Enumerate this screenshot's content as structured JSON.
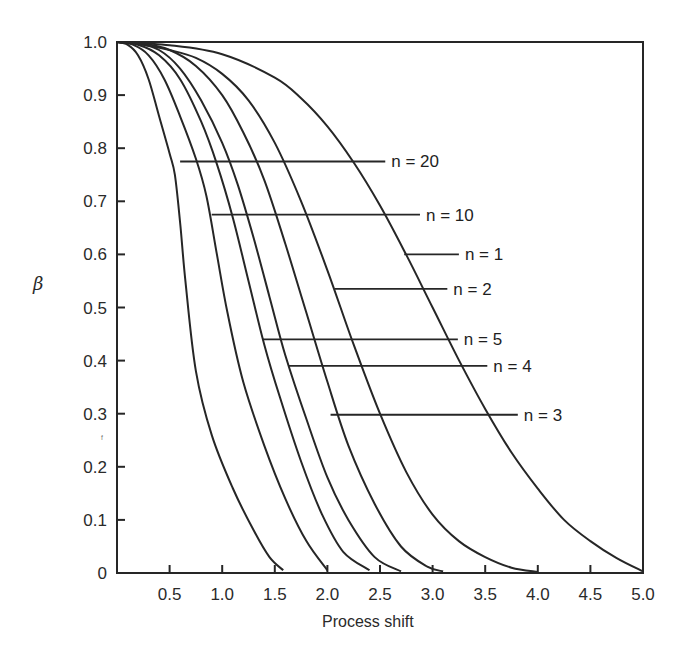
{
  "chart_data": {
    "type": "line",
    "title": "",
    "xlabel": "Process shift",
    "ylabel": "β",
    "xlim": [
      0,
      5.0
    ],
    "ylim": [
      0,
      1.0
    ],
    "grid": false,
    "x_ticks": [
      "0.5",
      "1.0",
      "1.5",
      "2.0",
      "2.5",
      "3.0",
      "3.5",
      "4.0",
      "4.5",
      "5.0"
    ],
    "x_tick_values": [
      0.5,
      1.0,
      1.5,
      2.0,
      2.5,
      3.0,
      3.5,
      4.0,
      4.5,
      5.0
    ],
    "y_ticks": [
      "0",
      "0.1",
      "0.2",
      "0.3",
      "0.4",
      "0.5",
      "0.6",
      "0.7",
      "0.8",
      "0.9",
      "1.0"
    ],
    "y_tick_values": [
      0,
      0.1,
      0.2,
      0.3,
      0.4,
      0.5,
      0.6,
      0.7,
      0.8,
      0.9,
      1.0
    ],
    "legend_position": "inline leader-line labels",
    "series": [
      {
        "name": "n = 20",
        "label_y": 0.775,
        "label_x_start": 0.6,
        "label_x_end": 2.55,
        "x": [
          0,
          0.1,
          0.2,
          0.3,
          0.4,
          0.5,
          0.55,
          0.6,
          0.65,
          0.75,
          0.9,
          1.1,
          1.3,
          1.45,
          1.58
        ],
        "y": [
          1.0,
          0.995,
          0.975,
          0.93,
          0.86,
          0.79,
          0.75,
          0.66,
          0.55,
          0.38,
          0.26,
          0.16,
          0.08,
          0.03,
          0.005
        ]
      },
      {
        "name": "n = 10",
        "label_y": 0.675,
        "label_x_start": 0.9,
        "label_x_end": 2.88,
        "x": [
          0,
          0.15,
          0.3,
          0.45,
          0.6,
          0.75,
          0.85,
          0.95,
          1.05,
          1.2,
          1.4,
          1.6,
          1.8,
          2.0
        ],
        "y": [
          1.0,
          0.995,
          0.975,
          0.93,
          0.86,
          0.78,
          0.71,
          0.6,
          0.49,
          0.36,
          0.24,
          0.14,
          0.06,
          0.005
        ]
      },
      {
        "name": "n = 5",
        "label_y": 0.44,
        "label_x_start": 1.38,
        "label_x_end": 3.24,
        "x": [
          0,
          0.2,
          0.4,
          0.6,
          0.8,
          0.95,
          1.1,
          1.25,
          1.4,
          1.55,
          1.75,
          1.95,
          2.15,
          2.4
        ],
        "y": [
          1.0,
          0.995,
          0.975,
          0.93,
          0.85,
          0.77,
          0.67,
          0.55,
          0.43,
          0.33,
          0.21,
          0.11,
          0.04,
          0.005
        ]
      },
      {
        "name": "n = 4",
        "label_y": 0.39,
        "label_x_start": 1.63,
        "label_x_end": 3.52,
        "x": [
          0,
          0.2,
          0.4,
          0.6,
          0.8,
          1.0,
          1.15,
          1.3,
          1.45,
          1.6,
          1.8,
          2.0,
          2.2,
          2.45,
          2.7
        ],
        "y": [
          1.0,
          0.997,
          0.985,
          0.95,
          0.89,
          0.81,
          0.73,
          0.63,
          0.52,
          0.41,
          0.29,
          0.18,
          0.1,
          0.03,
          0.003
        ]
      },
      {
        "name": "n = 3",
        "label_y": 0.298,
        "label_x_start": 2.03,
        "label_x_end": 3.81,
        "x": [
          0,
          0.25,
          0.5,
          0.75,
          1.0,
          1.2,
          1.4,
          1.6,
          1.8,
          2.0,
          2.2,
          2.45,
          2.7,
          2.95,
          3.1
        ],
        "y": [
          1.0,
          0.997,
          0.985,
          0.955,
          0.9,
          0.83,
          0.74,
          0.62,
          0.49,
          0.36,
          0.24,
          0.13,
          0.05,
          0.012,
          0.003
        ]
      },
      {
        "name": "n = 2",
        "label_y": 0.535,
        "label_x_start": 2.07,
        "label_x_end": 3.14,
        "x": [
          0,
          0.25,
          0.5,
          0.75,
          1.0,
          1.25,
          1.5,
          1.75,
          2.0,
          2.25,
          2.5,
          2.75,
          3.0,
          3.25,
          3.5,
          3.75,
          4.0
        ],
        "y": [
          1.0,
          0.995,
          0.985,
          0.97,
          0.94,
          0.89,
          0.81,
          0.7,
          0.57,
          0.43,
          0.3,
          0.19,
          0.11,
          0.06,
          0.03,
          0.01,
          0.002
        ]
      },
      {
        "name": "n = 1",
        "label_y": 0.6,
        "label_x_start": 2.73,
        "label_x_end": 3.25,
        "x": [
          0,
          0.5,
          1.0,
          1.5,
          1.75,
          2.0,
          2.25,
          2.5,
          2.75,
          3.0,
          3.25,
          3.5,
          3.75,
          4.0,
          4.25,
          4.5,
          4.75,
          5.0
        ],
        "y": [
          1.0,
          0.994,
          0.977,
          0.933,
          0.894,
          0.841,
          0.773,
          0.692,
          0.599,
          0.5,
          0.401,
          0.309,
          0.227,
          0.159,
          0.1,
          0.06,
          0.028,
          0.003
        ]
      }
    ]
  },
  "plot_area": {
    "left": 117,
    "right": 643,
    "top": 42,
    "bottom": 573
  },
  "labels": {
    "y_axis_symbol": "β",
    "x_axis_title": "Process shift",
    "stray_mark": "ᶠ"
  }
}
